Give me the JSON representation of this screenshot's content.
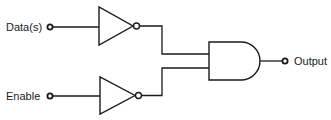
{
  "diagram": {
    "type": "logic-circuit",
    "inputs": [
      {
        "label": "Data(s)",
        "gate": "NOT"
      },
      {
        "label": "Enable",
        "gate": "NOT"
      }
    ],
    "combiner": {
      "gate": "AND",
      "input_count": 2
    },
    "output": {
      "label": "Output"
    },
    "colors": {
      "stroke": "#1a1a1a",
      "background": "#ffffff"
    }
  }
}
